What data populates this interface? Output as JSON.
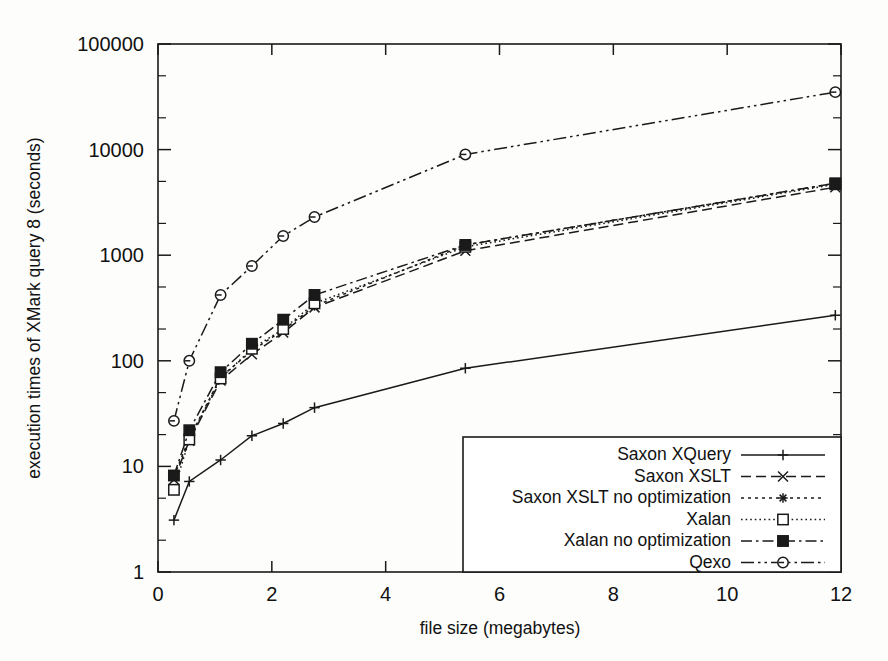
{
  "chart_data": {
    "type": "line",
    "title": "",
    "xlabel": "file size (megabytes)",
    "ylabel": "execution times of XMark query 8 (seconds)",
    "xlim": [
      0,
      12
    ],
    "ylim": [
      1,
      100000
    ],
    "yscale": "log",
    "xscale": "linear",
    "grid": false,
    "legend_position": "bottom-right",
    "xticks": [
      "0",
      "2",
      "4",
      "6",
      "8",
      "10",
      "12"
    ],
    "xtick_values": [
      0,
      2,
      4,
      6,
      8,
      10,
      12
    ],
    "yticks": [
      "1",
      "10",
      "100",
      "1000",
      "10000",
      "100000"
    ],
    "ytick_values": [
      1,
      10,
      100,
      1000,
      10000,
      100000
    ],
    "x": [
      0.28,
      0.55,
      1.1,
      1.65,
      2.2,
      2.75,
      5.4,
      11.9
    ],
    "series": [
      {
        "name": "Saxon XQuery",
        "marker": "plus",
        "linestyle": "solid",
        "x": [
          0.28,
          0.55,
          1.1,
          1.65,
          2.2,
          2.75,
          5.4,
          11.9
        ],
        "values": [
          3.1,
          7.2,
          11.5,
          19.5,
          25.5,
          36,
          85,
          270
        ]
      },
      {
        "name": "Saxon XSLT",
        "marker": "cross",
        "linestyle": "dashed",
        "x": [
          0.28,
          0.55,
          1.1,
          1.65,
          2.2,
          2.75,
          5.4,
          11.9
        ],
        "values": [
          7.5,
          17.5,
          65,
          115,
          185,
          320,
          1100,
          4400
        ]
      },
      {
        "name": "Saxon XSLT no optimization",
        "marker": "star",
        "linestyle": "dotted",
        "x": [
          0.28,
          0.55,
          1.1,
          1.65,
          2.2,
          2.75,
          5.4,
          11.9
        ],
        "values": [
          8.0,
          18.5,
          70,
          125,
          195,
          330,
          1250,
          4800
        ]
      },
      {
        "name": "Xalan",
        "marker": "open-square",
        "linestyle": "fine-dotted",
        "x": [
          0.28,
          0.55,
          1.1,
          1.65,
          2.2,
          2.75,
          5.4,
          11.9
        ],
        "values": [
          6.0,
          18.0,
          68,
          130,
          200,
          350,
          1200,
          4700
        ]
      },
      {
        "name": "Xalan no optimization",
        "marker": "filled-square",
        "linestyle": "dash-dot",
        "x": [
          0.28,
          0.55,
          1.1,
          1.65,
          2.2,
          2.75,
          5.4,
          11.9
        ],
        "values": [
          8.2,
          22,
          78,
          145,
          245,
          420,
          1250,
          4800
        ]
      },
      {
        "name": "Qexo",
        "marker": "open-circle",
        "linestyle": "dash-dot-dot",
        "x": [
          0.28,
          0.55,
          1.1,
          1.65,
          2.2,
          2.75,
          5.4,
          11.9
        ],
        "values": [
          27,
          100,
          420,
          790,
          1520,
          2300,
          9000,
          35000
        ]
      }
    ]
  },
  "legend": {
    "entries": [
      {
        "label": "Saxon XQuery"
      },
      {
        "label": "Saxon XSLT"
      },
      {
        "label": "Saxon XSLT no optimization"
      },
      {
        "label": "Xalan"
      },
      {
        "label": "Xalan no optimization"
      },
      {
        "label": "Qexo"
      }
    ]
  },
  "colors": {
    "ink": "#1a1a1a",
    "background": "#ffffff"
  }
}
